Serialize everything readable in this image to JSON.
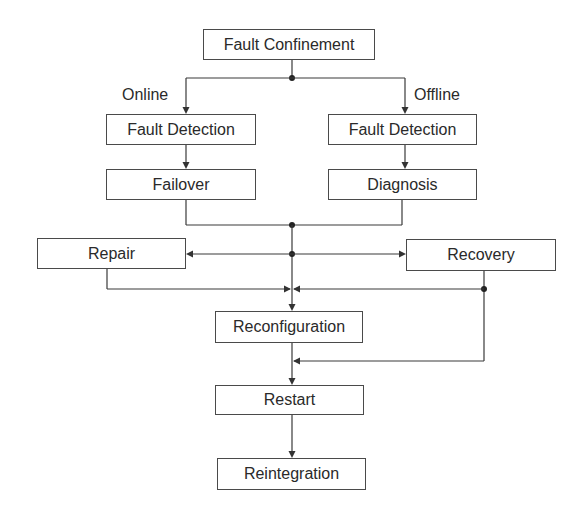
{
  "diagram": {
    "type": "flowchart",
    "nodes": {
      "fault_confinement": "Fault Confinement",
      "fault_detection_online": "Fault Detection",
      "fault_detection_offline": "Fault Detection",
      "failover": "Failover",
      "diagnosis": "Diagnosis",
      "repair": "Repair",
      "recovery": "Recovery",
      "reconfiguration": "Reconfiguration",
      "restart": "Restart",
      "reintegration": "Reintegration"
    },
    "edge_labels": {
      "online": "Online",
      "offline": "Offline"
    },
    "edges": [
      {
        "from": "Fault Confinement",
        "to": "Fault Detection (Online)",
        "label": "Online"
      },
      {
        "from": "Fault Confinement",
        "to": "Fault Detection (Offline)",
        "label": "Offline"
      },
      {
        "from": "Fault Detection (Online)",
        "to": "Failover"
      },
      {
        "from": "Fault Detection (Offline)",
        "to": "Diagnosis"
      },
      {
        "from": "Failover + Diagnosis",
        "to": "Repair"
      },
      {
        "from": "Failover + Diagnosis",
        "to": "Recovery"
      },
      {
        "from": "Failover + Diagnosis",
        "to": "Reconfiguration"
      },
      {
        "from": "Repair",
        "to": "Reconfiguration"
      },
      {
        "from": "Recovery",
        "to": "Reconfiguration"
      },
      {
        "from": "Recovery",
        "to": "Restart"
      },
      {
        "from": "Reconfiguration",
        "to": "Restart"
      },
      {
        "from": "Restart",
        "to": "Reintegration"
      }
    ],
    "colors": {
      "line": "#3a3a3a",
      "box_border": "#4a4a4a",
      "text": "#2a2a2a",
      "background": "#ffffff"
    }
  }
}
